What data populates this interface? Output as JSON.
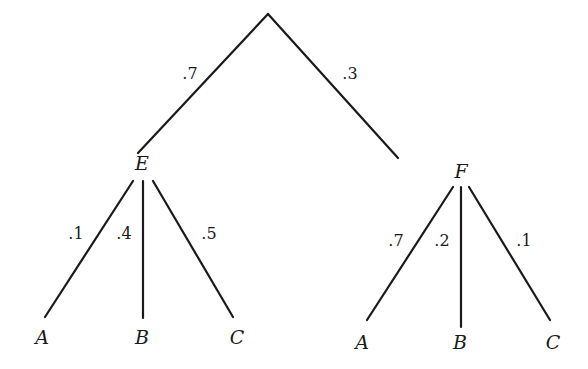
{
  "diagram": {
    "type": "probability-tree",
    "root": {
      "label": "",
      "branches": [
        {
          "probability": ".7",
          "node": {
            "label": "E",
            "branches": [
              {
                "probability": ".1",
                "leaf": "A"
              },
              {
                "probability": ".4",
                "leaf": "B"
              },
              {
                "probability": ".5",
                "leaf": "C"
              }
            ]
          }
        },
        {
          "probability": ".3",
          "node": {
            "label": "F",
            "branches": [
              {
                "probability": ".7",
                "leaf": "A"
              },
              {
                "probability": ".2",
                "leaf": "B"
              },
              {
                "probability": ".1",
                "leaf": "C"
              }
            ]
          }
        }
      ]
    }
  },
  "colors": {
    "line": "#1a1a1a",
    "background": "#ffffff"
  }
}
